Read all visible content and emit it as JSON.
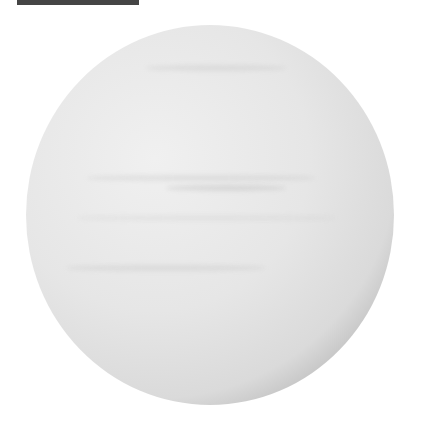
{
  "image": {
    "subject": "Shaded gas-giant planet sphere, white/gray banded, lit from upper left with dark terminator at lower right",
    "background_color": "#ffffff",
    "top_bar_color": "#454545",
    "sphere": {
      "center_x": 210,
      "center_y": 215,
      "radius_x": 184,
      "radius_y": 190,
      "highlight_color": "#f0f0f0",
      "shadow_color": "#000000"
    }
  }
}
